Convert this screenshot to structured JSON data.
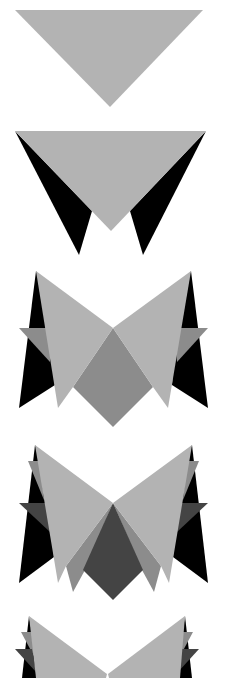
{
  "figure": {
    "steps": 5
  },
  "colors": {
    "background": "#ffffff",
    "light_gray": "#b3b3b3",
    "mid_gray": "#8c8c8c",
    "dark_gray": "#555555",
    "darker_gray": "#444444",
    "black": "#000000"
  }
}
